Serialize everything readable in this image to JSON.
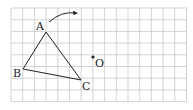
{
  "diagram": {
    "grid": {
      "cols": 15,
      "rows": 8,
      "x0": 11,
      "y0": 8,
      "cell": 11.7,
      "color": "#c8c8c8"
    },
    "points": {
      "A": {
        "label": "A",
        "x": 46,
        "y": 32
      },
      "B": {
        "label": "B",
        "x": 23,
        "y": 69
      },
      "C": {
        "label": "C",
        "x": 81,
        "y": 80
      },
      "O": {
        "label": "O",
        "x": 93,
        "y": 57
      }
    },
    "triangle": [
      "A",
      "B",
      "C"
    ],
    "arrow": {
      "from": [
        49,
        22
      ],
      "to": [
        78,
        13
      ],
      "description": "rotation arrow"
    }
  }
}
